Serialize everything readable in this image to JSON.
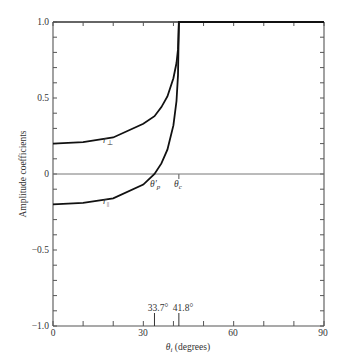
{
  "chart_data": {
    "type": "line",
    "title": "",
    "xlabel": "θi (degrees)",
    "ylabel": "Amplitude coefficients",
    "xlim": [
      0,
      90
    ],
    "ylim": [
      -1.0,
      1.0
    ],
    "x_tick_labels": [
      "0",
      "30",
      "60",
      "90"
    ],
    "x_ticks": [
      0,
      10,
      20,
      30,
      40,
      50,
      60,
      70,
      80,
      90
    ],
    "y_tick_labels": [
      "1.0",
      "0.5",
      "0",
      "−0.5",
      "−1.0"
    ],
    "y_tick_values": [
      1.0,
      0.5,
      0,
      -0.5,
      -1.0
    ],
    "grid": false,
    "legend": "none",
    "annotations": [
      {
        "text": "θ′p",
        "x": 33.7,
        "y": 0,
        "position": "below-axis"
      },
      {
        "text": "θc",
        "x": 41.8,
        "y": 0,
        "position": "below-axis"
      },
      {
        "text": "33.7°",
        "x": 33.7,
        "y": -1.0,
        "position": "above-bottom-axis"
      },
      {
        "text": "41.8°",
        "x": 41.8,
        "y": -1.0,
        "position": "above-bottom-axis"
      }
    ],
    "series": [
      {
        "name": "r⊥",
        "x": [
          0,
          10,
          20,
          30,
          33.7,
          36,
          38,
          40,
          41,
          41.5,
          41.8,
          50,
          60,
          70,
          80,
          90
        ],
        "values": [
          0.2,
          0.21,
          0.24,
          0.33,
          0.38,
          0.44,
          0.51,
          0.63,
          0.73,
          0.82,
          1.0,
          1.0,
          1.0,
          1.0,
          1.0,
          1.0
        ]
      },
      {
        "name": "r∥",
        "x": [
          0,
          10,
          20,
          30,
          33.7,
          36,
          38,
          40,
          41,
          41.5,
          41.8,
          50,
          60,
          70,
          80,
          90
        ],
        "values": [
          -0.2,
          -0.19,
          -0.16,
          -0.07,
          0.0,
          0.07,
          0.16,
          0.32,
          0.48,
          0.65,
          1.0,
          1.0,
          1.0,
          1.0,
          1.0,
          1.0
        ]
      }
    ]
  },
  "labels": {
    "y_axis_title": "Amplitude coefficients",
    "x_axis_title_symbol": "θ",
    "x_axis_title_sub": "i",
    "x_axis_title_rest": " (degrees)",
    "curve_perp_main": "r",
    "curve_perp_sub": "⊥",
    "curve_par_main": "r",
    "curve_par_sub": "||",
    "theta_p_main": "θ′",
    "theta_p_sub": "p",
    "theta_c_main": "θ",
    "theta_c_sub": "c",
    "angle_p_value": "33.7°",
    "angle_c_value": "41.8°",
    "y_ticks": [
      "1.0",
      "0.5",
      "0",
      "−0.5",
      "−1.0"
    ],
    "x_ticks": [
      "0",
      "30",
      "60",
      "90"
    ]
  }
}
